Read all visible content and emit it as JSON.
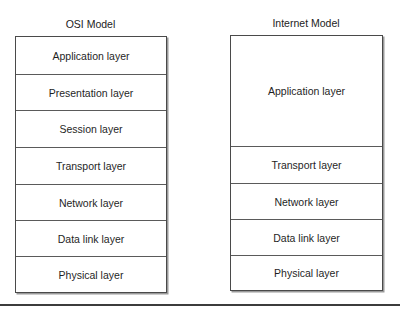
{
  "osi_model": {
    "title": "OSI Model",
    "layers": [
      {
        "label": "Application layer",
        "rows": 1
      },
      {
        "label": "Presentation layer",
        "rows": 1
      },
      {
        "label": "Session layer",
        "rows": 1
      },
      {
        "label": "Transport layer",
        "rows": 1
      },
      {
        "label": "Network layer",
        "rows": 1
      },
      {
        "label": "Data link layer",
        "rows": 1
      },
      {
        "label": "Physical layer",
        "rows": 1
      }
    ]
  },
  "internet_model": {
    "title": "Internet Model",
    "layers": [
      {
        "label": "Application layer",
        "rows": 3
      },
      {
        "label": "Transport layer",
        "rows": 1
      },
      {
        "label": "Network layer",
        "rows": 1
      },
      {
        "label": "Data link layer",
        "rows": 1
      },
      {
        "label": "Physical layer",
        "rows": 1
      }
    ]
  },
  "colors": {
    "border": "#4a4a4a",
    "text": "#1f1f1f",
    "rule": "#3c3c3c",
    "background": "#ffffff"
  }
}
